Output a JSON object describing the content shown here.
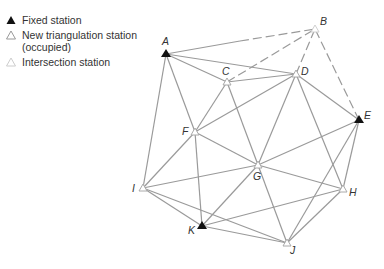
{
  "legend": {
    "items": [
      {
        "symbol": "filled-triangle",
        "label": "Fixed station",
        "color": "#111111"
      },
      {
        "symbol": "outline-triangle",
        "label": "New triangulation station\n(occupied)",
        "color": "#999999"
      },
      {
        "symbol": "light-outline-triangle",
        "label": "Intersection station",
        "color": "#cccccc"
      }
    ]
  },
  "colors": {
    "line": "#9a9a9a",
    "fixed": "#111111",
    "new_station": "#aaaaaa",
    "intersection": "#d0d0d0",
    "text": "#333333"
  },
  "stations": {
    "A": {
      "label": "A",
      "type": "fixed",
      "x": 166,
      "y": 54
    },
    "B": {
      "label": "B",
      "type": "intersection",
      "x": 315,
      "y": 29
    },
    "C": {
      "label": "C",
      "type": "new",
      "x": 227,
      "y": 82
    },
    "D": {
      "label": "D",
      "type": "new",
      "x": 296,
      "y": 74
    },
    "E": {
      "label": "E",
      "type": "fixed",
      "x": 359,
      "y": 120
    },
    "F": {
      "label": "F",
      "type": "new",
      "x": 195,
      "y": 132
    },
    "G": {
      "label": "G",
      "type": "new",
      "x": 258,
      "y": 165
    },
    "H": {
      "label": "H",
      "type": "new",
      "x": 343,
      "y": 189
    },
    "I": {
      "label": "I",
      "type": "new",
      "x": 143,
      "y": 188
    },
    "J": {
      "label": "J",
      "type": "new",
      "x": 287,
      "y": 243
    },
    "K": {
      "label": "K",
      "type": "fixed",
      "x": 202,
      "y": 226
    }
  }
}
